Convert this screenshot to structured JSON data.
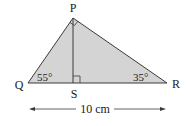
{
  "diagram": {
    "type": "geometry-triangle",
    "vertices": {
      "P": {
        "label": "P",
        "x": 73,
        "y": 18
      },
      "Q": {
        "label": "Q",
        "x": 28,
        "y": 83
      },
      "R": {
        "label": "R",
        "x": 167,
        "y": 83
      },
      "S": {
        "label": "S",
        "x": 73,
        "y": 83
      }
    },
    "angles": {
      "Q": "55°",
      "R": "35°"
    },
    "right_angles": [
      "P",
      "S"
    ],
    "dimension": {
      "label": "10 cm",
      "from": "Q",
      "to": "R"
    },
    "colors": {
      "fill": "#d4d4d4",
      "stroke": "#3a3a3a",
      "text": "#1a1a1a"
    }
  }
}
